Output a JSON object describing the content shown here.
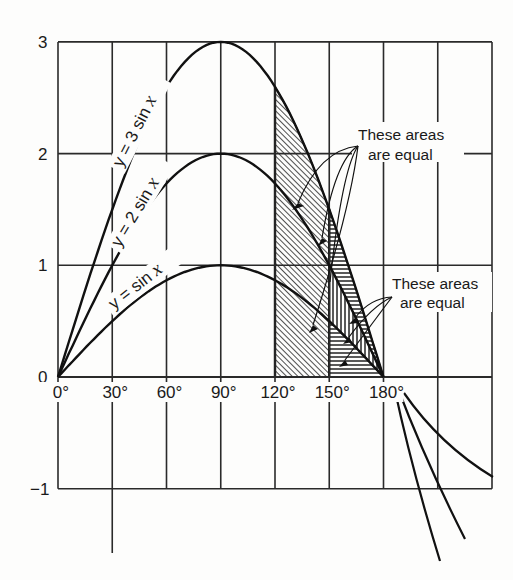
{
  "chart_data": {
    "type": "line",
    "title": "",
    "xlabel": "",
    "ylabel": "",
    "x_unit": "degrees",
    "x_ticks": [
      0,
      30,
      60,
      90,
      120,
      150,
      180
    ],
    "x_tick_labels": [
      "0°",
      "30°",
      "60°",
      "90°",
      "120°",
      "150°",
      "180°"
    ],
    "y_ticks": [
      3,
      2,
      1,
      0,
      -1
    ],
    "y_tick_labels": [
      "3",
      "2",
      "1",
      "0",
      "−1"
    ],
    "xlim": [
      0,
      240
    ],
    "ylim": [
      -1,
      3
    ],
    "grid": true,
    "grid_x_step": 30,
    "grid_y_step": 1,
    "x": [
      0,
      30,
      60,
      90,
      120,
      150,
      180
    ],
    "series": [
      {
        "name": "y = 3 sin x",
        "values": [
          0,
          1.5,
          2.598,
          3,
          2.598,
          1.5,
          0
        ]
      },
      {
        "name": "y = 2 sin x",
        "values": [
          0,
          1,
          1.732,
          2,
          1.732,
          1,
          0
        ]
      },
      {
        "name": "y = sin x",
        "values": [
          0,
          0.5,
          0.866,
          1,
          0.866,
          0.5,
          0
        ]
      }
    ],
    "curve_labels": {
      "s3": {
        "prefix": "y = 3 sin ",
        "var": "x"
      },
      "s2": {
        "prefix": "y = 2 sin ",
        "var": "x"
      },
      "s1": {
        "prefix": "y = sin ",
        "var": "x"
      }
    },
    "shaded_regions": [
      {
        "x_range": [
          120,
          150
        ],
        "between": [
          "0",
          "y = 3 sin x"
        ],
        "hatch": "diagonal"
      },
      {
        "x_range": [
          150,
          180
        ],
        "between": [
          "y = 2 sin x",
          "y = 3 sin x"
        ],
        "hatch": "horizontal"
      },
      {
        "x_range": [
          150,
          180
        ],
        "between": [
          "y = sin x",
          "y = 2 sin x"
        ],
        "hatch": "vertical"
      },
      {
        "x_range": [
          150,
          180
        ],
        "between": [
          "0",
          "y = sin x"
        ],
        "hatch": "horizontal"
      }
    ],
    "annotations": [
      {
        "line1": "These areas",
        "line2": "are equal",
        "target": "120°–150° region vs. 150°–180° region"
      },
      {
        "line1": "These areas",
        "line2": "are equal",
        "target": "150°–180° sub-regions"
      }
    ]
  }
}
